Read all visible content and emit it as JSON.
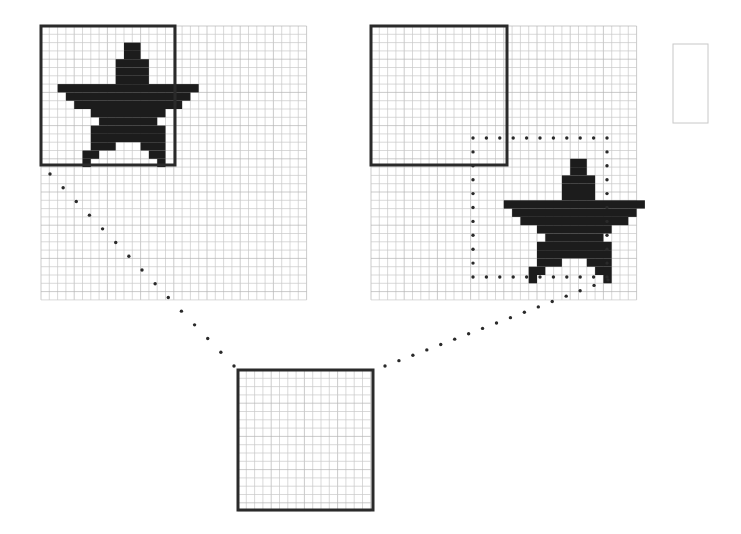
{
  "figure": {
    "width": 741,
    "height": 534,
    "colors": {
      "background": "#ffffff",
      "grid_line": "#c8c8c8",
      "grid_line_major": "#b4b4b4",
      "window_border": "#2a2a2a",
      "star_fill": "#1c1c1c",
      "dot": "#2a2a2a",
      "faint_box": "#c8c8c8"
    },
    "cell": 8.3,
    "star_rows": [
      {
        "r": 2,
        "spans": [
          [
            10,
            11
          ]
        ]
      },
      {
        "r": 3,
        "spans": [
          [
            10,
            11
          ]
        ]
      },
      {
        "r": 4,
        "spans": [
          [
            9,
            12
          ]
        ]
      },
      {
        "r": 5,
        "spans": [
          [
            9,
            12
          ]
        ]
      },
      {
        "r": 6,
        "spans": [
          [
            9,
            12
          ]
        ]
      },
      {
        "r": 7,
        "spans": [
          [
            2,
            18
          ]
        ]
      },
      {
        "r": 8,
        "spans": [
          [
            3,
            17
          ]
        ]
      },
      {
        "r": 9,
        "spans": [
          [
            4,
            16
          ]
        ]
      },
      {
        "r": 10,
        "spans": [
          [
            6,
            14
          ]
        ]
      },
      {
        "r": 11,
        "spans": [
          [
            7,
            13
          ]
        ]
      },
      {
        "r": 12,
        "spans": [
          [
            6,
            14
          ]
        ]
      },
      {
        "r": 13,
        "spans": [
          [
            6,
            14
          ]
        ]
      },
      {
        "r": 14,
        "spans": [
          [
            6,
            8
          ],
          [
            12,
            14
          ]
        ]
      },
      {
        "r": 15,
        "spans": [
          [
            5,
            6
          ],
          [
            13,
            14
          ]
        ]
      },
      {
        "r": 16,
        "spans": [
          [
            5,
            5
          ],
          [
            14,
            14
          ]
        ]
      }
    ],
    "panels": [
      {
        "name": "left-grid",
        "x": 41,
        "y": 26,
        "cols": 32,
        "rows": 33,
        "window": {
          "x": 41,
          "y": 26,
          "w": 134,
          "h": 139
        },
        "star_offset": {
          "col": 0,
          "row": 0
        },
        "dotted_box": null
      },
      {
        "name": "right-grid",
        "x": 371,
        "y": 26,
        "cols": 32,
        "rows": 33,
        "window": {
          "x": 371,
          "y": 26,
          "w": 136,
          "h": 139
        },
        "star_offset": {
          "col": 14,
          "row": 14
        },
        "dotted_box": {
          "x": 473,
          "y": 138,
          "w": 134,
          "h": 139
        }
      }
    ],
    "zoom_window": {
      "name": "bottom-window",
      "x": 238,
      "y": 370,
      "w": 135,
      "h": 140,
      "cols": 16,
      "rows": 17
    },
    "faint_box": {
      "x": 673,
      "y": 44,
      "w": 35,
      "h": 79
    },
    "leaders": [
      {
        "name": "leader-left",
        "from": [
          50,
          174
        ],
        "to": [
          234,
          366
        ],
        "count": 14
      },
      {
        "name": "leader-right",
        "from": [
          385,
          366
        ],
        "to": [
          608,
          280
        ],
        "count": 16
      }
    ]
  }
}
